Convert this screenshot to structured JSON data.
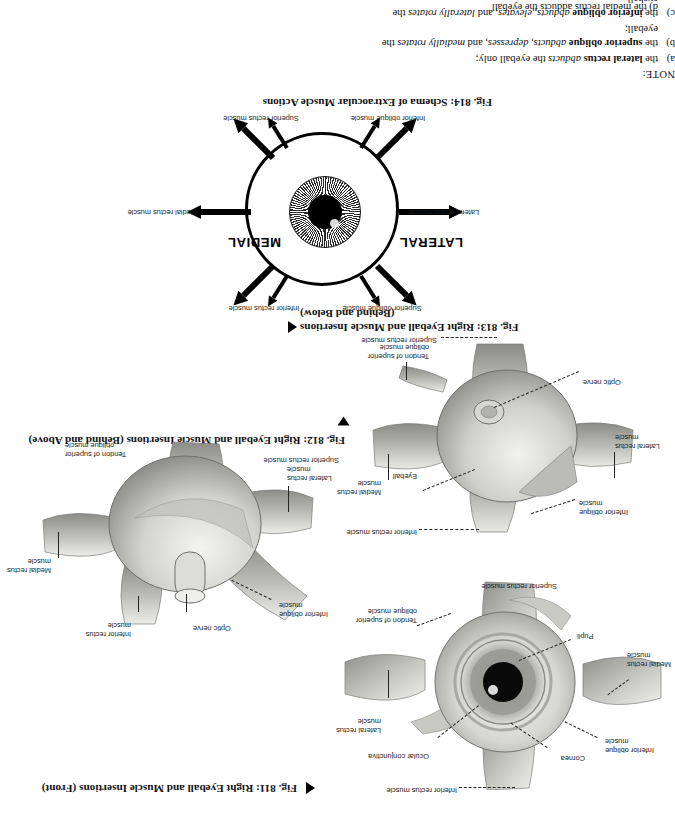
{
  "page": {
    "orientation": "rotated-180",
    "background": "#ffffff",
    "ink": "#111111"
  },
  "note": {
    "heading": "NOTE:",
    "items": [
      {
        "mark": "a)",
        "html": "the <b>lateral rectus</b> <i>abducts</i> the eyeball only;"
      },
      {
        "mark": "b)",
        "html": "the <b>superior oblique</b> <i>abducts, depresses,</i> and <i>medially rotates</i> the eyeball;"
      },
      {
        "mark": "c)",
        "html": "the <b>inferior oblique</b> <i>abducts, elevates,</i> and <i>laterally rotates</i> the eyeball."
      }
    ],
    "cut_off_line": "d)   the medial rectus adducts the eyeball"
  },
  "figures": [
    {
      "id": "fig-814",
      "caption": "Fig. 814: Schema of Extraocular Muscle Actions",
      "marker": "none",
      "direction_labels": {
        "lateral": "LATERAL",
        "medial": "MEDIAL"
      },
      "labels": [
        "Superior oblique muscle",
        "Inferior rectus muscle",
        "Medial rectus muscle",
        "Lateral rectus muscle",
        "Superior rectus muscle",
        "Inferior oblique muscle"
      ]
    },
    {
      "id": "fig-813",
      "caption_line1": "Fig. 813: Right Eyeball and Muscle Insertions",
      "caption_line2": "(Behind and Below)",
      "marker": "triangle-left",
      "labels": [
        "Inferior rectus muscle",
        "Inferior oblique muscle",
        "Eyeball",
        "Medial rectus muscle",
        "Lateral rectus muscle",
        "Optic nerve",
        "Tendon of superior oblique muscle",
        "Superior rectus muscle"
      ]
    },
    {
      "id": "fig-812",
      "caption": "Fig. 812: Right Eyeball and Muscle Insertions (Behind and Above)",
      "marker": "triangle-down",
      "labels": [
        "Optic nerve",
        "Inferior rectus muscle",
        "Inferior oblique muscle",
        "Medial rectus muscle",
        "Lateral rectus muscle",
        "Tendon of superior oblique muscle",
        "Superior rectus muscle"
      ]
    },
    {
      "id": "fig-811",
      "caption": "Fig. 811: Right Eyeball and Muscle Insertions (Front)",
      "marker": "triangle-left",
      "labels": [
        "Inferior rectus muscle",
        "Cornea",
        "Ocular conjunctiva",
        "Inferior oblique muscle",
        "Lateral rectus muscle",
        "Medial rectus muscle",
        "Pupil",
        "Tendon of superior oblique muscle",
        "Superior rectus muscle"
      ]
    }
  ],
  "fig814_labels": {
    "superior_oblique": "Superior oblique muscle",
    "inferior_rectus": "Inferior rectus muscle",
    "medial_rectus": "Medial rectus muscle",
    "lateral_rectus": "Lateral rectus muscle",
    "superior_rectus": "Superior rectus muscle",
    "inferior_oblique": "Inferior oblique muscle",
    "lateral": "LATERAL",
    "medial": "MEDIAL"
  },
  "fig813_labels": {
    "inferior_rectus": "Inferior rectus muscle",
    "inferior_oblique": "Inferior oblique\nmuscle",
    "eyeball": "Eyeball",
    "medial_rectus": "Medial rectus\nmuscle",
    "lateral_rectus": "Lateral rectus\nmuscle",
    "optic_nerve": "Optic nerve",
    "tendon_superior_oblique": "Tendon of superior\noblique muscle",
    "superior_rectus": "Superior rectus muscle"
  },
  "fig812_labels": {
    "optic_nerve": "Optic nerve",
    "inferior_rectus": "Inferior rectus\nmuscle",
    "inferior_oblique": "Inferior oblique\nmuscle",
    "medial_rectus": "Medial rectus\nmuscle",
    "lateral_rectus": "Lateral rectus\nmuscle",
    "tendon_superior_oblique": "Tendon of superior\noblique muscle",
    "superior_rectus": "Superior rectus muscle"
  },
  "fig811_labels": {
    "inferior_rectus": "Inferior rectus muscle",
    "cornea": "Cornea",
    "ocular_conjunctiva": "Ocular conjunctiva",
    "inferior_oblique": "Inferior oblique\nmuscle",
    "lateral_rectus": "Lateral rectus\nmuscle",
    "medial_rectus": "Medial rectus\nmuscle",
    "pupil": "Pupil",
    "tendon_superior_oblique": "Tendon of superior\noblique muscle",
    "superior_rectus": "Superior rectus muscle"
  },
  "captions": {
    "fig814": "Fig. 814: Schema of Extraocular Muscle Actions",
    "fig813_l1": "Fig. 813: Right Eyeball and Muscle Insertions",
    "fig813_l2": "(Behind and Below)",
    "fig812": "Fig. 812: Right Eyeball and Muscle Insertions (Behind and Above)",
    "fig811": "Fig. 811: Right Eyeball and Muscle Insertions (Front)"
  }
}
